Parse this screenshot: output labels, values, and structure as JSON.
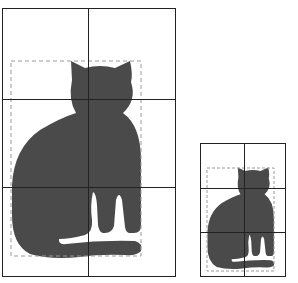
{
  "diagram": {
    "colors": {
      "silhouette": "#4a4a4a",
      "grid_line": "#222222",
      "bounding_box": "#9a9a9a",
      "background": "#ffffff"
    },
    "figures": [
      {
        "name": "large-grid",
        "grid": {
          "columns": 2,
          "rows": 3
        },
        "frame": {
          "x": 2,
          "y": 8,
          "width": 173,
          "height": 268
        }
      },
      {
        "name": "small-grid",
        "grid": {
          "columns": 2,
          "rows": 3
        },
        "frame": {
          "x": 200,
          "y": 143,
          "width": 85,
          "height": 133
        }
      }
    ]
  }
}
